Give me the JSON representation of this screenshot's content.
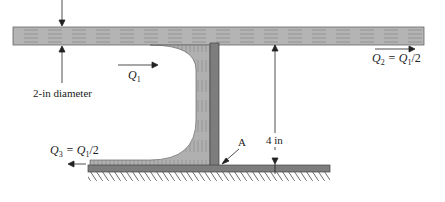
{
  "diagram": {
    "labels": {
      "diameter": "2-in diameter",
      "q1": "Q",
      "q1_sub": "1",
      "q2": "Q",
      "q2_sub": "2",
      "q2_eq": " = Q",
      "q2_eq_sub": "1",
      "q2_tail": "/2",
      "q3": "Q",
      "q3_sub": "3",
      "q3_eq": " = Q",
      "q3_eq_sub": "1",
      "q3_tail": "/2",
      "height": "4 in",
      "point": "A"
    },
    "colors": {
      "fluid": "#a9a9a9",
      "plate": "#7d7d7d",
      "line": "#222222"
    }
  }
}
